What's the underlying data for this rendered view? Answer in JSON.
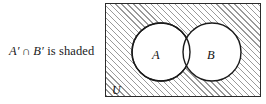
{
  "figure": {
    "name": "venn-diagram-complement-intersection",
    "caption": {
      "set_a": "A′",
      "operator": "∩",
      "set_b": "B′",
      "predicate": "is shaded",
      "full_text": "A′ ∩ B′ is shaded"
    },
    "universe_label": "U",
    "circles": [
      {
        "label": "A",
        "cx": 55,
        "cy": 48,
        "r": 29
      },
      {
        "label": "B",
        "cx": 106,
        "cy": 48,
        "r": 29
      }
    ],
    "shading": {
      "region": "outside both circles",
      "pattern": "diagonal-hatch-45",
      "hatch_color": "#9a9a9a",
      "background_color": "#ffffff"
    },
    "colors": {
      "stroke": "#1a1a1a",
      "box_border": "#2b2b2b",
      "circle_fill": "#ffffff",
      "text": "#141414"
    }
  }
}
